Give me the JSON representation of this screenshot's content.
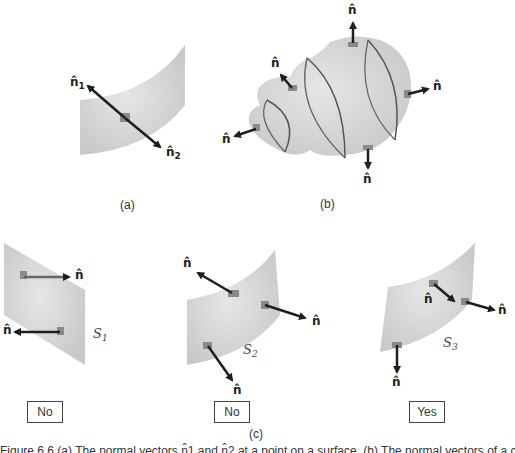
{
  "panels": {
    "a": {
      "label": "(a)",
      "normals": [
        {
          "symbol": "n̂",
          "subscript": "1"
        },
        {
          "symbol": "n̂",
          "subscript": "2"
        }
      ]
    },
    "b": {
      "label": "(b)",
      "normals": [
        "n̂",
        "n̂",
        "n̂",
        "n̂",
        "n̂"
      ]
    },
    "c": {
      "label": "(c)",
      "surfaces": [
        {
          "name": "S",
          "subscript": "1",
          "normals": [
            "n̂",
            "n̂"
          ],
          "orientable_answer": "No"
        },
        {
          "name": "S",
          "subscript": "2",
          "normals": [
            "n̂",
            "n̂",
            "n̂"
          ],
          "orientable_answer": "No"
        },
        {
          "name": "S",
          "subscript": "3",
          "normals": [
            "n̂",
            "n̂",
            "n̂"
          ],
          "orientable_answer": "Yes"
        }
      ]
    }
  },
  "caption": "Figure 6.6 (a) The normal vectors n̂1 and n̂2 at a point on a surface. (b) The normal vectors of a closed surface.",
  "colors": {
    "surface": "#d6d6d6",
    "surface_dark": "#c4c4c4",
    "curve": "#666666",
    "arrow": "#1e1e1e",
    "patch": "#8a8a8a"
  }
}
